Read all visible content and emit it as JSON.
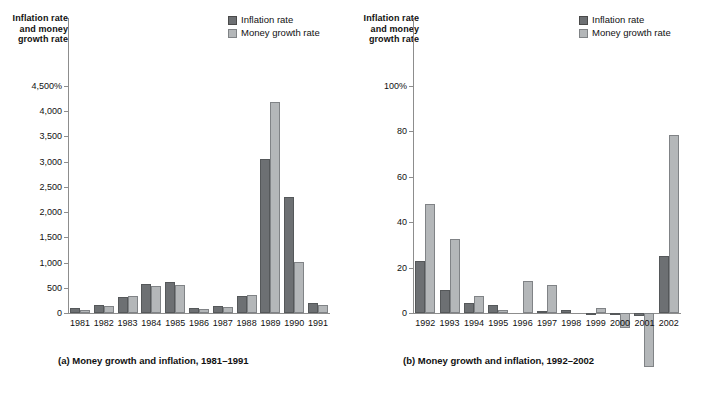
{
  "figure": {
    "legend": [
      {
        "key": "inflation",
        "label": "Inflation rate",
        "color": "#6d7073"
      },
      {
        "key": "money",
        "label": "Money growth rate",
        "color": "#b4b7b9"
      }
    ]
  },
  "panel_a": {
    "axis_title": "Inflation rate and money growth rate",
    "caption": "(a) Money growth and inflation, 1981–1991",
    "y_ticks": [
      "4,500%",
      "4,000",
      "3,500",
      "3,000",
      "2,500",
      "2,000",
      "1,500",
      "1,000",
      "500",
      "0"
    ],
    "legend": [
      {
        "label": "Inflation rate",
        "color": "#6d7073"
      },
      {
        "label": "Money growth rate",
        "color": "#b4b7b9"
      }
    ]
  },
  "panel_b": {
    "axis_title": "Inflation rate and money growth rate",
    "caption": "(b) Money growth and inflation, 1992–2002",
    "y_ticks": [
      "100%",
      "80",
      "60",
      "40",
      "20",
      "0"
    ],
    "legend": [
      {
        "label": "Inflation rate",
        "color": "#6d7073"
      },
      {
        "label": "Money growth rate",
        "color": "#b4b7b9"
      }
    ]
  },
  "chart_data": [
    {
      "id": "panel_a",
      "type": "bar",
      "title": "(a) Money growth and inflation, 1981–1991",
      "xlabel": "",
      "ylabel": "Inflation rate and money growth rate",
      "ylim": [
        0,
        4500
      ],
      "ytick_values": [
        0,
        500,
        1000,
        1500,
        2000,
        2500,
        3000,
        3500,
        4000,
        4500
      ],
      "ytick_labels": [
        "0",
        "500",
        "1,000",
        "1,500",
        "2,000",
        "2,500",
        "3,000",
        "3,500",
        "4,000",
        "4,500%"
      ],
      "grid": false,
      "legend_position": "top-right",
      "categories": [
        "1981",
        "1982",
        "1983",
        "1984",
        "1985",
        "1986",
        "1987",
        "1988",
        "1989",
        "1990",
        "1991"
      ],
      "series": [
        {
          "name": "Inflation rate",
          "color": "#6d7073",
          "values": [
            95,
            165,
            325,
            580,
            620,
            90,
            145,
            345,
            3050,
            2300,
            195
          ]
        },
        {
          "name": "Money growth rate",
          "color": "#b4b7b9",
          "values": [
            50,
            135,
            340,
            545,
            550,
            85,
            115,
            355,
            4175,
            1020,
            160
          ]
        }
      ]
    },
    {
      "id": "panel_b",
      "type": "bar",
      "title": "(b) Money growth and inflation, 1992–2002",
      "xlabel": "",
      "ylabel": "Inflation rate and money growth rate",
      "ylim": [
        -30,
        100
      ],
      "ytick_values": [
        0,
        20,
        40,
        60,
        80,
        100
      ],
      "ytick_labels": [
        "0",
        "20",
        "40",
        "60",
        "80",
        "100%"
      ],
      "grid": false,
      "legend_position": "top-right",
      "categories": [
        "1992",
        "1993",
        "1994",
        "1995",
        "1996",
        "1997",
        "1998",
        "1999",
        "2000",
        "2001",
        "2002"
      ],
      "series": [
        {
          "name": "Inflation rate",
          "color": "#6d7073",
          "values": [
            23.0,
            10.0,
            4.5,
            3.5,
            0.0,
            0.8,
            1.3,
            -0.7,
            -1.0,
            -1.2,
            25.0
          ]
        },
        {
          "name": "Money growth rate",
          "color": "#b4b7b9",
          "values": [
            48.0,
            32.5,
            7.5,
            1.5,
            14.0,
            12.5,
            0.0,
            2.0,
            -6.5,
            -24.0,
            78.5
          ]
        }
      ]
    }
  ]
}
